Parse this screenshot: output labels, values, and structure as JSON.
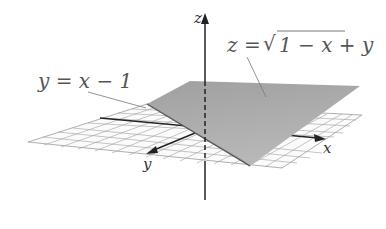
{
  "figure": {
    "type": "3d-surface-plot",
    "surface_label": "z = √(1 − x + y)",
    "surface_label_parts": {
      "lhs": "z =",
      "radical": "√",
      "radicand": "1 − x + y"
    },
    "boundary_label": "y = x − 1",
    "axes": {
      "x": "x",
      "y": "y",
      "z": "z"
    },
    "colors": {
      "surface": "#a8a8a8",
      "surface_dark": "#8f8f8f",
      "grid": "#9a9a9a",
      "axis": "#222222",
      "label": "#555555",
      "leader": "#777777"
    }
  }
}
